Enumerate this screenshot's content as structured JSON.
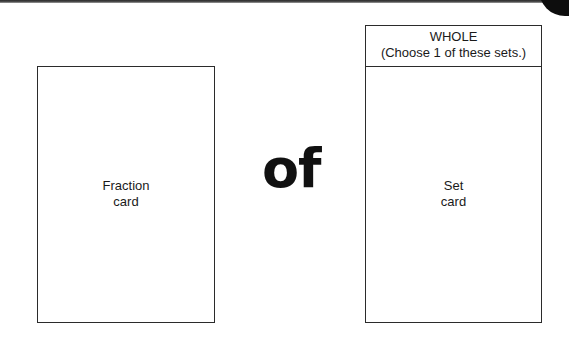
{
  "page": {
    "connector_word": "of"
  },
  "fraction_card": {
    "label_line1": "Fraction",
    "label_line2": "card"
  },
  "set_card": {
    "header_title": "WHOLE",
    "header_instruction": "(Choose 1 of these sets.)",
    "label_line1": "Set",
    "label_line2": "card"
  }
}
